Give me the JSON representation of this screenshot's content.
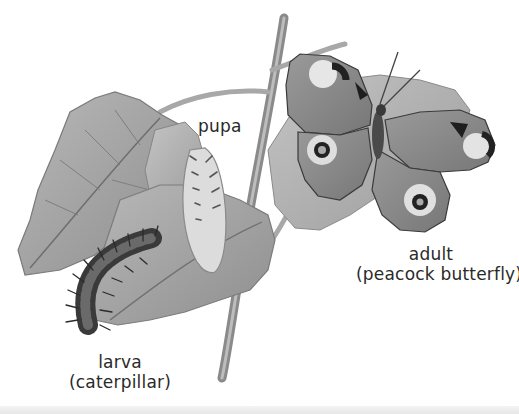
{
  "diagram": {
    "style": "grayscale illustration",
    "stages": [
      {
        "id": "larva",
        "lines": [
          "larva",
          "(caterpillar)"
        ]
      },
      {
        "id": "pupa",
        "lines": [
          "pupa"
        ]
      },
      {
        "id": "adult",
        "lines": [
          "adult",
          "(peacock butterfly)"
        ]
      }
    ]
  },
  "colors": {
    "background": "#ffffff",
    "text": "#2a2a2a",
    "leaf": "#9a9a9a",
    "stem": "#8c8c8c",
    "dark": "#2b2b2b"
  }
}
